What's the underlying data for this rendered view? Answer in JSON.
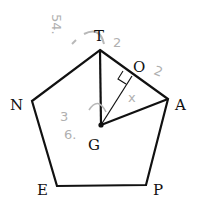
{
  "diagram": {
    "type": "regular pentagon geometry figure",
    "vertices": [
      {
        "label": "T",
        "x": 100,
        "y": 50,
        "label_x": 94,
        "label_y": 41
      },
      {
        "label": "A",
        "x": 168,
        "y": 99,
        "label_x": 175,
        "label_y": 110
      },
      {
        "label": "P",
        "x": 146,
        "y": 185,
        "label_x": 153,
        "label_y": 195
      },
      {
        "label": "E",
        "x": 57,
        "y": 186,
        "label_x": 37,
        "label_y": 195
      },
      {
        "label": "N",
        "x": 32,
        "y": 101,
        "label_x": 10,
        "label_y": 110
      }
    ],
    "center": {
      "label": "G",
      "x": 101,
      "y": 125,
      "label_x": 88,
      "label_y": 150
    },
    "foot": {
      "label": "O",
      "x": 132,
      "y": 76,
      "label_x": 133,
      "label_y": 72
    },
    "segments": [
      "TG",
      "GA",
      "GO"
    ],
    "right_angle_at": "O",
    "annotations": [
      {
        "text": "54.",
        "x": 55,
        "y": 22,
        "rotate": 90
      },
      {
        "text": "2",
        "x": 113,
        "y": 47,
        "rotate": 0
      },
      {
        "text": "2",
        "x": 153,
        "y": 74,
        "rotate": 20
      },
      {
        "text": "x",
        "x": 128,
        "y": 102,
        "rotate": 0
      },
      {
        "text": "3",
        "x": 60,
        "y": 121,
        "rotate": 0
      },
      {
        "text": "6.",
        "x": 64,
        "y": 139,
        "rotate": 0
      }
    ],
    "line_color": "#111111",
    "annotation_color": "#b0b0b0"
  }
}
